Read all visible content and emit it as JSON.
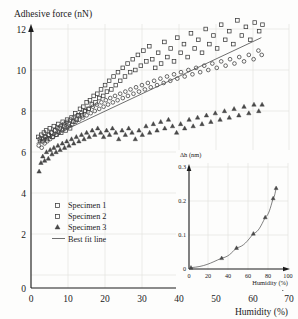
{
  "chart_data": [
    {
      "id": "main",
      "type": "scatter",
      "title": "Adhesive force (nN)",
      "xlabel": "Humidity (%)",
      "ylabel": "Adhesive force (nN)",
      "xlim": [
        0,
        70
      ],
      "ylim": [
        0,
        13
      ],
      "xticks": [
        0,
        10,
        20,
        30,
        40,
        50,
        60,
        70
      ],
      "yticks": [
        0,
        2,
        4,
        6,
        8,
        10,
        12
      ],
      "grid": true,
      "legend_position": "lower-left-inside",
      "legend": [
        {
          "label": "Specimen 1",
          "marker": "square"
        },
        {
          "label": "Specimen 2",
          "marker": "square"
        },
        {
          "label": "Specimen 3",
          "marker": "triangle"
        },
        {
          "label": "Best fit line",
          "marker": "line"
        }
      ],
      "series": [
        {
          "name": "Specimen 1",
          "marker": "square",
          "points": [
            [
              2.0,
              7.0
            ],
            [
              2.4,
              6.9
            ],
            [
              2.8,
              7.1
            ],
            [
              3.1,
              6.8
            ],
            [
              3.5,
              7.2
            ],
            [
              3.8,
              7.0
            ],
            [
              4.1,
              7.3
            ],
            [
              4.4,
              6.9
            ],
            [
              4.8,
              7.1
            ],
            [
              5.1,
              7.4
            ],
            [
              5.5,
              7.2
            ],
            [
              5.8,
              7.0
            ],
            [
              6.2,
              7.5
            ],
            [
              6.6,
              7.3
            ],
            [
              7.0,
              7.1
            ],
            [
              7.4,
              7.6
            ],
            [
              7.8,
              7.4
            ],
            [
              8.2,
              7.2
            ],
            [
              8.6,
              7.7
            ],
            [
              9.0,
              7.5
            ],
            [
              9.4,
              7.3
            ],
            [
              9.8,
              7.8
            ],
            [
              10.2,
              7.6
            ],
            [
              10.6,
              7.4
            ],
            [
              11.0,
              7.9
            ],
            [
              11.5,
              7.7
            ],
            [
              12.0,
              8.1
            ],
            [
              12.4,
              7.8
            ],
            [
              12.9,
              8.0
            ],
            [
              13.3,
              8.3
            ],
            [
              13.8,
              8.0
            ],
            [
              14.2,
              8.4
            ],
            [
              14.7,
              8.2
            ],
            [
              15.1,
              8.6
            ],
            [
              15.6,
              8.3
            ],
            [
              16.0,
              8.7
            ],
            [
              16.5,
              8.5
            ],
            [
              17.0,
              8.9
            ],
            [
              17.5,
              8.6
            ],
            [
              18.0,
              9.0
            ],
            [
              18.5,
              8.8
            ],
            [
              19.0,
              9.2
            ],
            [
              19.6,
              8.9
            ],
            [
              20.1,
              9.4
            ],
            [
              20.6,
              9.1
            ],
            [
              21.2,
              9.6
            ],
            [
              21.8,
              9.2
            ],
            [
              22.4,
              9.8
            ],
            [
              23.0,
              9.4
            ],
            [
              23.6,
              10.0
            ],
            [
              24.2,
              9.6
            ],
            [
              24.9,
              10.2
            ],
            [
              25.5,
              9.8
            ],
            [
              26.2,
              10.4
            ],
            [
              26.9,
              10.0
            ],
            [
              27.6,
              10.6
            ],
            [
              28.3,
              10.1
            ],
            [
              29.0,
              10.8
            ],
            [
              29.8,
              10.3
            ],
            [
              30.5,
              11.0
            ],
            [
              31.3,
              10.5
            ],
            [
              32.1,
              11.2
            ],
            [
              32.9,
              10.6
            ],
            [
              33.7,
              10.2
            ],
            [
              34.5,
              10.9
            ],
            [
              35.3,
              10.4
            ],
            [
              36.2,
              11.4
            ],
            [
              37.0,
              10.7
            ],
            [
              37.9,
              11.1
            ],
            [
              38.8,
              10.5
            ],
            [
              39.7,
              11.6
            ],
            [
              40.6,
              10.9
            ],
            [
              41.5,
              11.3
            ],
            [
              42.5,
              10.7
            ],
            [
              43.4,
              11.8
            ],
            [
              44.4,
              11.1
            ],
            [
              45.4,
              11.5
            ],
            [
              46.4,
              10.9
            ],
            [
              47.4,
              12.0
            ],
            [
              48.4,
              11.3
            ],
            [
              49.5,
              11.7
            ],
            [
              50.5,
              11.1
            ],
            [
              51.6,
              12.2
            ],
            [
              52.7,
              11.5
            ],
            [
              53.8,
              11.9
            ],
            [
              54.9,
              11.3
            ],
            [
              56.0,
              12.4
            ],
            [
              57.2,
              11.7
            ],
            [
              58.3,
              12.1
            ],
            [
              59.5,
              11.5
            ],
            [
              60.7,
              12.3
            ],
            [
              61.9,
              11.9
            ],
            [
              62.8,
              12.2
            ]
          ]
        },
        {
          "name": "Specimen 2",
          "marker": "circle",
          "points": [
            [
              2.1,
              6.6
            ],
            [
              2.5,
              6.8
            ],
            [
              2.9,
              6.5
            ],
            [
              3.3,
              6.9
            ],
            [
              3.7,
              6.7
            ],
            [
              4.0,
              7.0
            ],
            [
              4.4,
              6.8
            ],
            [
              4.8,
              7.1
            ],
            [
              5.2,
              6.9
            ],
            [
              5.6,
              7.2
            ],
            [
              6.0,
              7.0
            ],
            [
              6.4,
              7.3
            ],
            [
              6.8,
              7.1
            ],
            [
              7.2,
              7.4
            ],
            [
              7.6,
              7.2
            ],
            [
              8.0,
              7.5
            ],
            [
              8.5,
              7.3
            ],
            [
              8.9,
              7.6
            ],
            [
              9.3,
              7.4
            ],
            [
              9.8,
              7.7
            ],
            [
              10.2,
              7.5
            ],
            [
              10.7,
              7.8
            ],
            [
              11.2,
              7.6
            ],
            [
              11.6,
              7.9
            ],
            [
              12.1,
              7.7
            ],
            [
              12.6,
              8.0
            ],
            [
              13.1,
              7.8
            ],
            [
              13.6,
              8.1
            ],
            [
              14.1,
              7.9
            ],
            [
              14.6,
              8.2
            ],
            [
              15.1,
              8.0
            ],
            [
              15.7,
              8.3
            ],
            [
              16.2,
              8.1
            ],
            [
              16.8,
              8.4
            ],
            [
              17.3,
              8.2
            ],
            [
              17.9,
              8.5
            ],
            [
              18.5,
              8.3
            ],
            [
              19.1,
              8.6
            ],
            [
              19.7,
              8.4
            ],
            [
              20.3,
              8.7
            ],
            [
              20.9,
              8.5
            ],
            [
              21.5,
              8.8
            ],
            [
              22.2,
              8.6
            ],
            [
              22.8,
              8.9
            ],
            [
              23.5,
              8.7
            ],
            [
              24.2,
              9.0
            ],
            [
              24.9,
              8.8
            ],
            [
              25.6,
              9.1
            ],
            [
              26.3,
              8.9
            ],
            [
              27.0,
              9.2
            ],
            [
              27.8,
              9.0
            ],
            [
              28.5,
              9.3
            ],
            [
              29.3,
              9.1
            ],
            [
              30.1,
              9.4
            ],
            [
              30.9,
              9.2
            ],
            [
              31.7,
              9.5
            ],
            [
              32.5,
              9.3
            ],
            [
              33.4,
              9.6
            ],
            [
              34.2,
              9.4
            ],
            [
              35.1,
              9.7
            ],
            [
              36.0,
              9.5
            ],
            [
              36.9,
              9.8
            ],
            [
              37.8,
              9.6
            ],
            [
              38.8,
              9.9
            ],
            [
              39.7,
              9.7
            ],
            [
              40.7,
              10.0
            ],
            [
              41.7,
              9.8
            ],
            [
              42.7,
              10.1
            ],
            [
              43.8,
              9.9
            ],
            [
              44.8,
              10.2
            ],
            [
              45.9,
              10.0
            ],
            [
              47.0,
              10.3
            ],
            [
              48.1,
              10.1
            ],
            [
              49.2,
              10.4
            ],
            [
              50.4,
              10.2
            ],
            [
              51.6,
              10.5
            ],
            [
              52.8,
              10.3
            ],
            [
              54.0,
              10.6
            ],
            [
              55.2,
              10.4
            ],
            [
              56.5,
              10.7
            ],
            [
              57.8,
              10.5
            ],
            [
              59.1,
              10.8
            ],
            [
              60.4,
              10.6
            ],
            [
              61.7,
              11.0
            ],
            [
              62.6,
              10.8
            ]
          ]
        },
        {
          "name": "Specimen 3",
          "marker": "triangle",
          "points": [
            [
              2.2,
              5.4
            ],
            [
              2.7,
              5.8
            ],
            [
              3.2,
              6.1
            ],
            [
              3.7,
              5.9
            ],
            [
              4.2,
              6.3
            ],
            [
              4.7,
              6.0
            ],
            [
              5.2,
              6.4
            ],
            [
              5.7,
              6.2
            ],
            [
              6.2,
              6.5
            ],
            [
              6.8,
              6.3
            ],
            [
              7.3,
              6.6
            ],
            [
              7.9,
              6.4
            ],
            [
              8.5,
              6.7
            ],
            [
              9.1,
              6.5
            ],
            [
              9.7,
              6.8
            ],
            [
              10.3,
              6.6
            ],
            [
              11.0,
              6.9
            ],
            [
              11.6,
              6.7
            ],
            [
              12.3,
              7.0
            ],
            [
              13.0,
              6.8
            ],
            [
              13.7,
              7.1
            ],
            [
              14.4,
              6.9
            ],
            [
              15.1,
              7.2
            ],
            [
              15.8,
              7.0
            ],
            [
              16.6,
              7.3
            ],
            [
              17.3,
              7.1
            ],
            [
              18.1,
              7.4
            ],
            [
              18.9,
              7.2
            ],
            [
              19.7,
              7.0
            ],
            [
              20.5,
              7.3
            ],
            [
              21.3,
              7.1
            ],
            [
              22.1,
              7.4
            ],
            [
              23.0,
              7.2
            ],
            [
              23.8,
              6.9
            ],
            [
              24.7,
              7.3
            ],
            [
              25.6,
              7.1
            ],
            [
              26.5,
              7.4
            ],
            [
              27.4,
              7.2
            ],
            [
              28.3,
              6.9
            ],
            [
              29.3,
              7.3
            ],
            [
              30.2,
              7.1
            ],
            [
              31.2,
              7.5
            ],
            [
              32.2,
              7.2
            ],
            [
              33.2,
              7.6
            ],
            [
              34.2,
              7.3
            ],
            [
              35.2,
              7.7
            ],
            [
              36.3,
              7.4
            ],
            [
              37.3,
              7.8
            ],
            [
              38.4,
              7.5
            ],
            [
              39.5,
              7.2
            ],
            [
              40.6,
              7.6
            ],
            [
              41.7,
              7.4
            ],
            [
              42.9,
              7.8
            ],
            [
              44.0,
              7.5
            ],
            [
              45.2,
              7.9
            ],
            [
              46.4,
              7.6
            ],
            [
              47.6,
              8.0
            ],
            [
              48.8,
              7.7
            ],
            [
              50.0,
              8.1
            ],
            [
              51.3,
              7.8
            ],
            [
              52.5,
              8.2
            ],
            [
              53.8,
              7.9
            ],
            [
              55.1,
              8.3
            ],
            [
              56.4,
              8.0
            ],
            [
              57.8,
              8.4
            ],
            [
              59.1,
              8.1
            ],
            [
              60.5,
              8.5
            ],
            [
              61.8,
              8.2
            ],
            [
              62.7,
              8.5
            ]
          ]
        }
      ],
      "fit_line": {
        "x0": 1.5,
        "y0": 6.7,
        "x1": 62.5,
        "y1": 11.6
      }
    },
    {
      "id": "inset",
      "type": "line",
      "xlabel": "Humidity (%)",
      "ylabel": "Δh (nm)",
      "xlim": [
        0,
        100
      ],
      "ylim": [
        0,
        0.3
      ],
      "xticks": [
        0,
        20,
        40,
        60,
        80,
        100
      ],
      "yticks": [
        0,
        0.1,
        0.2,
        0.3
      ],
      "grid": true,
      "marker": "triangle",
      "x": [
        2,
        33,
        48,
        65,
        77,
        85,
        88
      ],
      "y": [
        0.004,
        0.032,
        0.062,
        0.104,
        0.152,
        0.208,
        0.238
      ]
    }
  ]
}
